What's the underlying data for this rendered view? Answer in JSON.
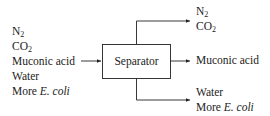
{
  "inputs": {
    "lines": [
      {
        "main": "N",
        "sub": "2",
        "italic": ""
      },
      {
        "main": "CO",
        "sub": "2",
        "italic": ""
      },
      {
        "main": "Muconic acid",
        "sub": "",
        "italic": ""
      },
      {
        "main": "Water",
        "sub": "",
        "italic": ""
      },
      {
        "main": "More ",
        "sub": "",
        "italic": "E. coli"
      }
    ]
  },
  "unit": {
    "label": "Separator"
  },
  "outputs": {
    "top": [
      {
        "main": "N",
        "sub": "2"
      },
      {
        "main": "CO",
        "sub": "2"
      }
    ],
    "middle": {
      "main": "Muconic acid"
    },
    "bottom": [
      {
        "main": "Water",
        "italic": ""
      },
      {
        "main": "More ",
        "italic": "E. coli"
      }
    ]
  }
}
